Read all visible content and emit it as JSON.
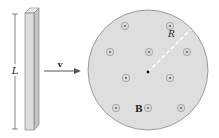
{
  "labels": {
    "length": "L",
    "velocity": "v",
    "radius": "R",
    "field": "B"
  },
  "colors": {
    "rod_fill": "#dcdcdc",
    "rod_edge": "#777777",
    "region_fill": "#dedede",
    "region_edge": "#888888",
    "dot_ring": "#8a8a8a",
    "radius_line": "#ffffff"
  },
  "field_symbols": [
    {
      "x": 125,
      "y": 26
    },
    {
      "x": 170,
      "y": 26
    },
    {
      "x": 110,
      "y": 52
    },
    {
      "x": 149,
      "y": 52
    },
    {
      "x": 187,
      "y": 52
    },
    {
      "x": 126,
      "y": 78
    },
    {
      "x": 170,
      "y": 78
    },
    {
      "x": 116,
      "y": 108
    },
    {
      "x": 148,
      "y": 108
    },
    {
      "x": 181,
      "y": 108
    }
  ]
}
